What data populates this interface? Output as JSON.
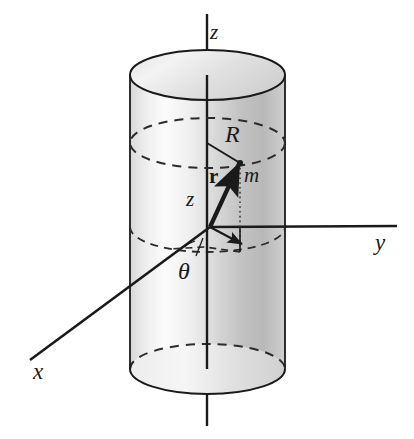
{
  "figure": {
    "background_color": "#ffffff",
    "ink_color": "#1a1a1a",
    "cylinder_fill_light": "#f2f2f2",
    "cylinder_fill_mid": "#d9d9d9",
    "cylinder_fill_dark": "#b5b5b5",
    "cap_fill": "#e8e8e8"
  },
  "labels": {
    "z_top": "z",
    "R": "R",
    "r_vector": "r",
    "m": "m",
    "z_height": "z",
    "y_axis": "y",
    "theta": "θ",
    "x_axis": "x"
  },
  "geometry": {
    "cylinder": {
      "center_x": 207.5,
      "radius_x": 77.5,
      "radius_y": 25,
      "top_ellipse_center_y": 75,
      "bottom_ellipse_center_y": 369,
      "mid_dashed_ellipse_center_y": 143,
      "base_dashed_ellipse_center_y": 227
    },
    "origin": {
      "x": 210,
      "y": 227
    },
    "point_m": {
      "x": 240,
      "y": 163
    },
    "z_axis": {
      "x": 207,
      "y_top": 14,
      "y_bottom": 426
    },
    "y_axis_end": {
      "x": 397,
      "y": 226
    },
    "x_axis_end": {
      "x": 30,
      "y": 360
    }
  }
}
